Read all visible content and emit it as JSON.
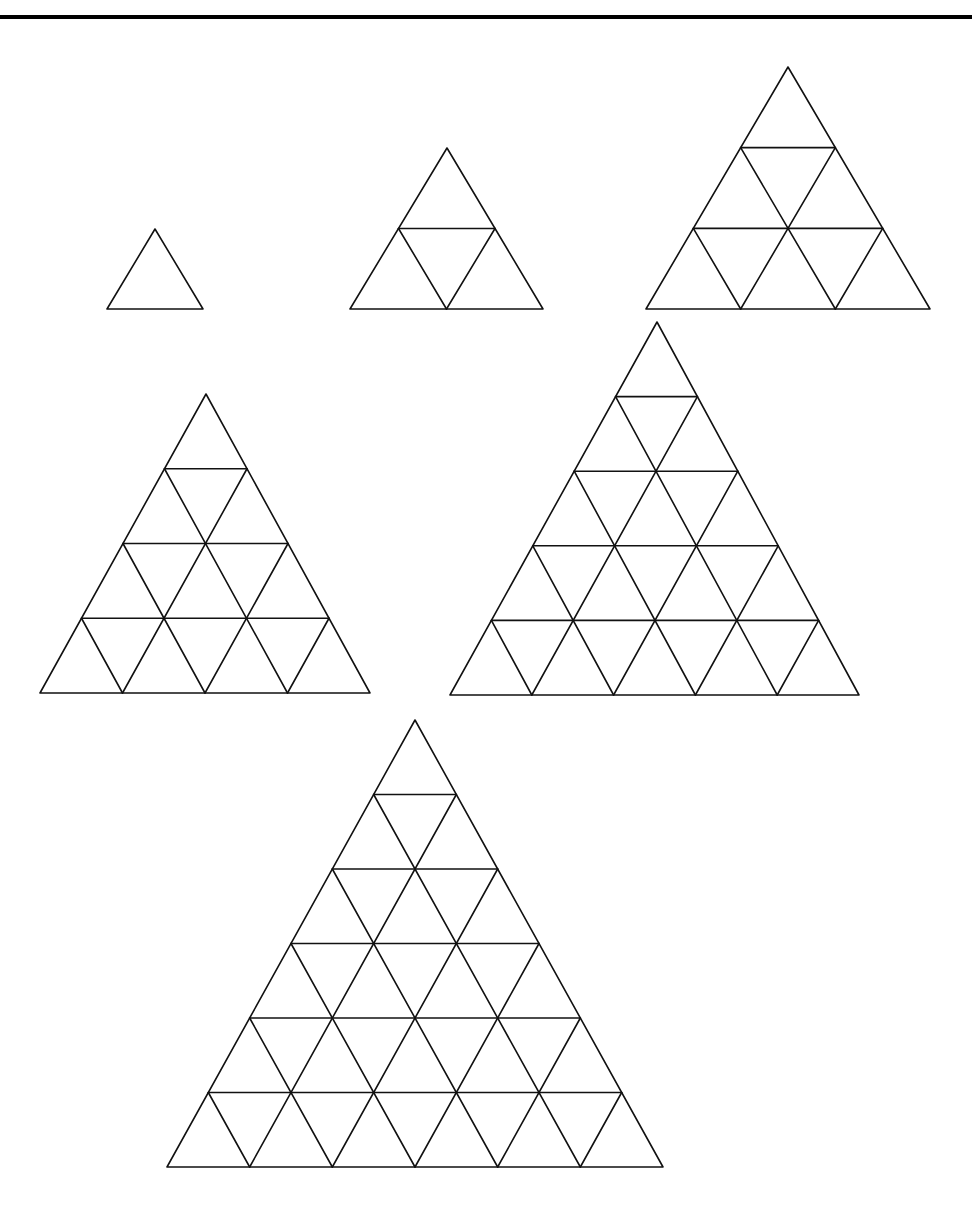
{
  "diagram": {
    "stroke_color": "#111111",
    "background_color": "#ffffff",
    "top_rule": {
      "y": 17,
      "thickness": 4,
      "color": "#000000"
    },
    "triangles": [
      {
        "id": "triangle-1-row",
        "rows": 1,
        "apex": [
          155,
          229
        ],
        "base_y": 309,
        "base_left": 107,
        "base_right": 203
      },
      {
        "id": "triangle-2-rows",
        "rows": 2,
        "apex": [
          447,
          148
        ],
        "base_y": 309,
        "base_left": 350,
        "base_right": 543
      },
      {
        "id": "triangle-3-rows",
        "rows": 3,
        "apex": [
          788,
          67
        ],
        "base_y": 309,
        "base_left": 646,
        "base_right": 930
      },
      {
        "id": "triangle-4-rows",
        "rows": 4,
        "apex": [
          206,
          394
        ],
        "base_y": 693,
        "base_left": 40,
        "base_right": 370
      },
      {
        "id": "triangle-5-rows",
        "rows": 5,
        "apex": [
          657,
          322
        ],
        "base_y": 695,
        "base_left": 450,
        "base_right": 859
      },
      {
        "id": "triangle-6-rows",
        "rows": 6,
        "apex": [
          415,
          720
        ],
        "base_y": 1167,
        "base_left": 167,
        "base_right": 663
      }
    ]
  }
}
